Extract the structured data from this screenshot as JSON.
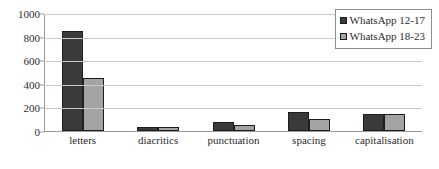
{
  "chart_data": {
    "type": "bar",
    "title": "",
    "subtitle": "",
    "xlabel": "",
    "ylabel": "",
    "categories": [
      "letters",
      "diacritics",
      "punctuation",
      "spacing",
      "capitalisation"
    ],
    "series": [
      {
        "name": "WhatsApp 12-17",
        "color": "#3a3a3a",
        "values": [
          845,
          35,
          75,
          160,
          140
        ]
      },
      {
        "name": "WhatsApp 18-23",
        "color": "#a3a3a3",
        "values": [
          450,
          38,
          55,
          100,
          148
        ]
      }
    ],
    "ylim": [
      0,
      1000
    ],
    "yticks": [
      0,
      200,
      400,
      600,
      800,
      1000
    ],
    "ytick_labels": [
      "0",
      "200",
      "400",
      "600",
      "800",
      "1000"
    ],
    "grid": true,
    "legend_position": "top-right",
    "annotations": []
  },
  "legend": {
    "entries": [
      {
        "label": "WhatsApp 12-17",
        "marker": "square-dark-icon"
      },
      {
        "label": "WhatsApp 18-23",
        "marker": "square-light-icon"
      }
    ]
  },
  "colors": {
    "series_dark": "#3a3a3a",
    "series_light": "#a3a3a3",
    "gridline": "#c8c8c8",
    "axis": "#9a9a9a",
    "text": "#2b2b2b",
    "background": "#ffffff"
  }
}
